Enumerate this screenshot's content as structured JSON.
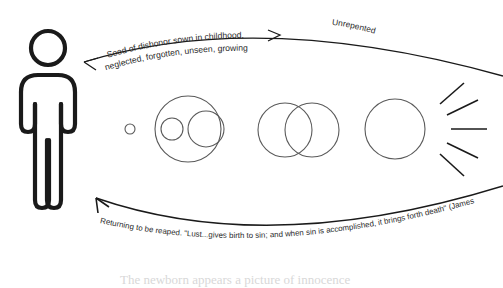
{
  "diagram": {
    "labels": {
      "top_line1": "Seed of dishonor sown in childhood,",
      "top_line2": "neglected, forgotten, unseen, growing",
      "top_right": "Unrepented",
      "bottom": "Returning to be reaped. \"Lust...gives birth to sin; and when sin is accomplished, it brings forth death\" (James 1:15)."
    },
    "figure": {
      "name": "standing person pictogram"
    },
    "circles": [
      {
        "name": "seed-dot",
        "cx": 130,
        "cy": 129,
        "r": 5
      },
      {
        "name": "growth-stage-1",
        "cx": 188,
        "cy": 129,
        "r": 33
      },
      {
        "name": "growth-stage-1a",
        "cx": 172,
        "cy": 129,
        "r": 11
      },
      {
        "name": "growth-stage-1b",
        "cx": 206,
        "cy": 129,
        "r": 18
      },
      {
        "name": "growth-stage-2",
        "cx": 285,
        "cy": 130,
        "r": 27
      },
      {
        "name": "growth-stage-3",
        "cx": 312,
        "cy": 130,
        "r": 27
      },
      {
        "name": "growth-stage-4",
        "cx": 395,
        "cy": 129,
        "r": 30
      }
    ],
    "rays": {
      "name": "radiating-burst",
      "count": 5
    },
    "arrows": {
      "top": "right",
      "bottom": "left"
    },
    "colors": {
      "ink": "#1a1a1a",
      "circle_stroke": "#4a4a4a",
      "text": "#2b2b2b"
    },
    "cut_text": "The newborn appears a picture of innocence"
  }
}
